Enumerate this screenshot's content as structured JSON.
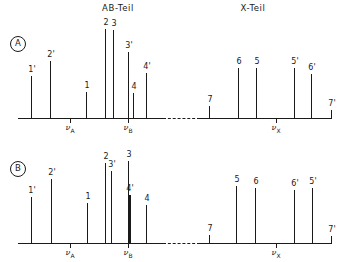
{
  "figure": {
    "headers": [
      {
        "label": "AB-Teil",
        "x": 118,
        "y": 3
      },
      {
        "label": "X-Teil",
        "x": 253,
        "y": 3
      }
    ],
    "nu_symbol": "ν"
  },
  "chart_data": {
    "type": "bar",
    "subtitle": "Two simulated ABX NMR stick spectra, panels A and B",
    "xlabel": "",
    "ylabel": "relative intensity",
    "grid": false,
    "legend": "none",
    "axis_note": "frequency axis increases to the right; AB-Teil and X-Teil separated by a dashed baseline gap",
    "panels": [
      {
        "id": "A",
        "tag": "A",
        "baseline_y": 118,
        "top_y": 22,
        "axis_x0": 18,
        "axis_x1": 332,
        "dash_gap": [
          163,
          200
        ],
        "reference_lines": [
          {
            "label": "ν",
            "sub": "A",
            "x": 70
          },
          {
            "label": "ν",
            "sub": "B",
            "x": 128
          },
          {
            "label": "ν",
            "sub": "X",
            "x": 276
          }
        ],
        "peaks": [
          {
            "label": "1'",
            "x": 31,
            "height": 42
          },
          {
            "label": "2'",
            "x": 50,
            "height": 57
          },
          {
            "label": "1",
            "x": 86,
            "height": 26
          },
          {
            "label": "2",
            "x": 105,
            "height": 89
          },
          {
            "label": "3",
            "x": 113,
            "height": 88
          },
          {
            "label": "3'",
            "x": 128,
            "height": 66
          },
          {
            "label": "4",
            "x": 133,
            "height": 25
          },
          {
            "label": "4'",
            "x": 146,
            "height": 45
          },
          {
            "label": "7",
            "x": 209,
            "height": 12
          },
          {
            "label": "6",
            "x": 238,
            "height": 50
          },
          {
            "label": "5",
            "x": 256,
            "height": 50
          },
          {
            "label": "5'",
            "x": 294,
            "height": 50
          },
          {
            "label": "6'",
            "x": 311,
            "height": 44
          },
          {
            "label": "7'",
            "x": 331,
            "height": 8
          }
        ]
      },
      {
        "id": "B",
        "tag": "B",
        "baseline_y": 243,
        "top_y": 150,
        "axis_x0": 18,
        "axis_x1": 332,
        "dash_gap": [
          163,
          200
        ],
        "reference_lines": [
          {
            "label": "ν",
            "sub": "A",
            "x": 70
          },
          {
            "label": "ν",
            "sub": "B",
            "x": 128
          },
          {
            "label": "ν",
            "sub": "X",
            "x": 276
          }
        ],
        "peaks": [
          {
            "label": "1'",
            "x": 31,
            "height": 46
          },
          {
            "label": "2'",
            "x": 51,
            "height": 64
          },
          {
            "label": "1",
            "x": 87,
            "height": 40
          },
          {
            "label": "2",
            "x": 105,
            "height": 80
          },
          {
            "label": "3'",
            "x": 111,
            "height": 72
          },
          {
            "label": "3",
            "x": 128,
            "height": 82
          },
          {
            "label": "4'",
            "x": 129,
            "height": 48,
            "wide": true
          },
          {
            "label": "4",
            "x": 146,
            "height": 38
          },
          {
            "label": "7",
            "x": 209,
            "height": 8
          },
          {
            "label": "5",
            "x": 236,
            "height": 57
          },
          {
            "label": "6",
            "x": 255,
            "height": 55
          },
          {
            "label": "6'",
            "x": 294,
            "height": 53
          },
          {
            "label": "5'",
            "x": 312,
            "height": 55
          },
          {
            "label": "7'",
            "x": 331,
            "height": 7
          }
        ]
      }
    ]
  }
}
